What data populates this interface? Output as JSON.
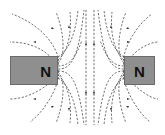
{
  "diagram": {
    "left_magnet": {
      "pole_label": "N"
    },
    "right_magnet": {
      "pole_label": "N"
    },
    "colors": {
      "magnet_fill": "#8f8f8f",
      "field_line": "#333333",
      "background": "#ffffff"
    }
  }
}
